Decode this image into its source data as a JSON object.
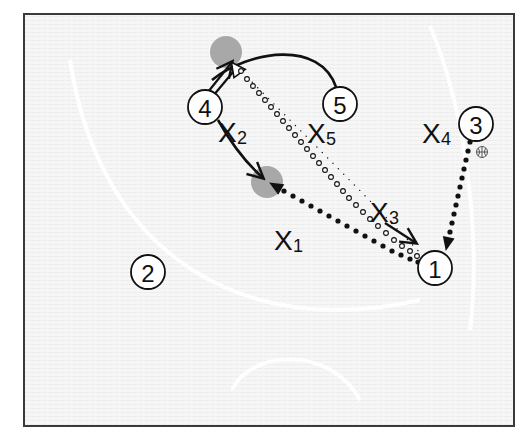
{
  "diagram": {
    "type": "basketball-play",
    "frame": {
      "x": 24,
      "y": 14,
      "width": 490,
      "height": 412,
      "border_color": "#3a3a3a",
      "fill": "#f4f4f4"
    },
    "colors": {
      "ink": "#111111",
      "screen_spot": "#a8a8a8",
      "court_line": "#ffffff"
    },
    "offense": [
      {
        "id": "1",
        "label": "1",
        "x": 435,
        "y": 268
      },
      {
        "id": "2",
        "label": "2",
        "x": 148,
        "y": 272
      },
      {
        "id": "3",
        "label": "3",
        "x": 476,
        "y": 124
      },
      {
        "id": "4",
        "label": "4",
        "x": 205,
        "y": 107
      },
      {
        "id": "5",
        "label": "5",
        "x": 340,
        "y": 104
      }
    ],
    "defense": [
      {
        "id": "X1",
        "letter": "X",
        "sub": "1",
        "x": 274,
        "y": 240
      },
      {
        "id": "X2",
        "letter": "X",
        "sub": "2",
        "x": 218,
        "y": 132
      },
      {
        "id": "X3",
        "letter": "X",
        "sub": "3",
        "x": 370,
        "y": 214
      },
      {
        "id": "X4",
        "letter": "X",
        "sub": "4",
        "x": 422,
        "y": 135
      },
      {
        "id": "X5",
        "letter": "X",
        "sub": "5",
        "x": 307,
        "y": 135
      }
    ],
    "screen_spots": [
      {
        "id": "top",
        "x": 226,
        "y": 52,
        "r": 16
      },
      {
        "id": "middle",
        "x": 267,
        "y": 182,
        "r": 16
      }
    ],
    "ball": {
      "icon": "basketball-icon",
      "x": 482,
      "y": 152,
      "holder": "3"
    },
    "actions": [
      {
        "type": "pass",
        "style": "dotted-solid",
        "from": "3",
        "to": "1",
        "description": "3 passes to 1"
      },
      {
        "type": "pass",
        "style": "dotted-solid",
        "from": "1",
        "to": "middle-spot",
        "description": "1 passes to middle"
      },
      {
        "type": "cut",
        "style": "solid-arrow",
        "from": "4",
        "to": "middle-spot",
        "description": "4 cuts to middle"
      },
      {
        "type": "cut",
        "style": "solid-double-arrow",
        "from": "4",
        "to": "top-spot",
        "description": "4 pops to top"
      },
      {
        "type": "cut",
        "style": "solid-curve",
        "from": "5",
        "to": "top-spot",
        "description": "5 curves to top"
      },
      {
        "type": "pass",
        "style": "hollow-dots",
        "from": "1",
        "to": "top-spot",
        "description": "skip pass to top"
      },
      {
        "type": "move",
        "style": "solid-arrow",
        "from": "X3",
        "to": "1",
        "description": "X3 closes out on 1"
      }
    ]
  }
}
